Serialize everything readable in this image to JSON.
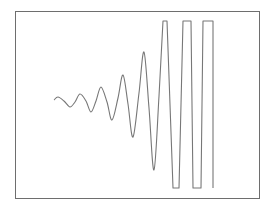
{
  "chart_data": {
    "type": "line",
    "title": "",
    "xlabel": "",
    "ylabel": "",
    "grid": false,
    "legend": null,
    "frame": {
      "x0": 15,
      "y0": 11,
      "x1": 259,
      "y1": 198
    },
    "clip_levels_px": {
      "top": 21,
      "bottom": 188
    },
    "series": [
      {
        "name": "signal",
        "color": "#777777",
        "points_px": [
          [
            54,
            100
          ],
          [
            58,
            97
          ],
          [
            64,
            101
          ],
          [
            70,
            107
          ],
          [
            75,
            102
          ],
          [
            80,
            94
          ],
          [
            86,
            101
          ],
          [
            91,
            112
          ],
          [
            96,
            101
          ],
          [
            101,
            87
          ],
          [
            107,
            102
          ],
          [
            112,
            120
          ],
          [
            118,
            98
          ],
          [
            123,
            75
          ],
          [
            128,
            104
          ],
          [
            133,
            137
          ],
          [
            139,
            93
          ],
          [
            144,
            52
          ],
          [
            149,
            108
          ],
          [
            154,
            170
          ],
          [
            159,
            96
          ],
          [
            163,
            21
          ],
          [
            167,
            21
          ],
          [
            173,
            188
          ],
          [
            179,
            188
          ],
          [
            183,
            21
          ],
          [
            191,
            21
          ],
          [
            193,
            188
          ],
          [
            201,
            188
          ],
          [
            203,
            21
          ],
          [
            213,
            21
          ],
          [
            213,
            188
          ]
        ]
      }
    ]
  },
  "colors": {
    "frame": "#6e6e6e",
    "line": "#777777",
    "background": "#ffffff"
  }
}
